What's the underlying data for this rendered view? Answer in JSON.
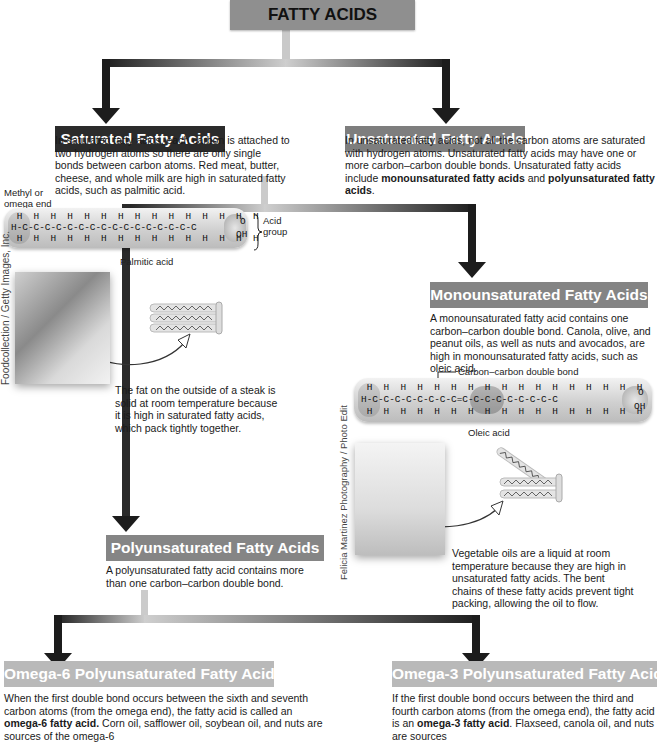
{
  "title": "FATTY ACIDS",
  "colors": {
    "title_bg": "#8f8f8f",
    "saturated_bg": "#2b2b2b",
    "unsaturated_bg": "#7e7e7e",
    "mono_bg": "#848484",
    "poly_bg": "#858585",
    "omega_bg": "#b9b9b9",
    "connector_dark": "#1e1e1e",
    "connector_light": "#c8c8c8"
  },
  "saturated": {
    "header": "Saturated Fatty Acids",
    "description": "In saturated fatty acids, each carbon is attached to two hydrogen atoms so there are only single bonds between carbon atoms. Red meat, butter, cheese, and whole milk are high in saturated fatty acids, such as palmitic acid.",
    "methyl_label": "Methyl or omega end",
    "acid_group_label": "Acid group",
    "molecule_name": "Palmitic acid",
    "molecule_top": " H  H  H  H  H  H  H  H  H  H  H  H  H  H  H",
    "molecule_mid": "H-C-C-C-C-C-C-C-C-C-C-C-C-C-C-C-C",
    "molecule_bot": " H  H  H  H  H  H  H  H  H  H  H  H  H  H  H",
    "photo_credit": "Foodcollection / Getty Images, Inc.",
    "photo_caption": "The fat on the outside of a steak is solid at room temperature because it is high in saturated fatty acids, which pack tightly together."
  },
  "unsaturated": {
    "header": "Unsaturated Fatty Acids",
    "description_plain": "In unsaturated fatty acids, not all the carbon atoms are saturated with hydrogen atoms. Unsaturated fatty acids may have one or more carbon–carbon double bonds. Unsaturated fatty acids include ",
    "bold_1": "monounsaturated fatty acids",
    "and": " and ",
    "bold_2": "polyunsaturated fatty acids",
    "end": "."
  },
  "monounsaturated": {
    "header": "Monounsaturated Fatty Acids",
    "description": "A monounsaturated fatty acid contains one carbon–carbon double bond. Canola, olive, and peanut oils, as well as nuts and avocados, are high in monounsaturated fatty acids, such as oleic acid.",
    "double_bond_label": "Carbon–carbon double bond",
    "molecule_name": "Oleic acid",
    "molecule_top": " H  H  H  H  H  H  H  H  H  H  H  H  H  H  H  H  H",
    "molecule_mid": "H-C-C-C-C-C-C-C-C=C-C-C-C-C-C-C-C-C",
    "molecule_bot": " H  H  H  H  H  H  H  H  H  H  H  H  H  H  H  H  H",
    "photo_credit": "Felicia Martinez Photography / Photo Edit",
    "photo_caption": "Vegetable oils are a liquid at room temperature because they are high in unsaturated fatty acids. The bent chains of these fatty acids prevent tight packing, allowing the oil to flow."
  },
  "polyunsaturated": {
    "header": "Polyunsaturated Fatty Acids",
    "description": "A polyunsaturated fatty acid contains more than one carbon–carbon double bond."
  },
  "omega6": {
    "header": "Omega-6 Polyunsaturated Fatty Acids",
    "desc_1": "When the first double bond occurs between the sixth and seventh carbon atoms (from the omega end), the fatty acid is called an ",
    "bold": "omega-6 fatty acid.",
    "desc_2": " Corn oil, safflower oil, soybean oil, and nuts are sources of the omega-6"
  },
  "omega3": {
    "header": "Omega-3 Polyunsaturated Fatty Acids",
    "desc_1": "If the first double bond occurs between the third and fourth carbon atoms (from the omega end), the fatty acid is an ",
    "bold": "omega-3 fatty acid",
    "desc_2": ". Flaxseed, canola oil, and nuts are sources"
  },
  "chem": {
    "acid_o": "O",
    "acid_oh": "OH",
    "acid_c": "C"
  }
}
